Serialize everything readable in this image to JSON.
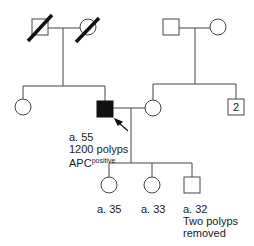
{
  "pedigree": {
    "generation_1": {
      "left_couple": {
        "father": {
          "sex": "male",
          "status": "deceased"
        },
        "mother": {
          "sex": "female",
          "status": "deceased"
        }
      },
      "right_couple": {
        "father": {
          "sex": "male",
          "status": "unaffected"
        },
        "mother": {
          "sex": "female",
          "status": "unaffected"
        }
      }
    },
    "generation_2": {
      "sister": {
        "sex": "female",
        "status": "unaffected"
      },
      "proband": {
        "sex": "male",
        "status": "affected",
        "age_label": "a. 55",
        "finding_label": "1200 polyps",
        "gene_label": "APC",
        "gene_superscript": "positive"
      },
      "spouse": {
        "sex": "female",
        "status": "unaffected"
      },
      "spouse_brothers": {
        "sex": "male",
        "count_label": "2"
      }
    },
    "generation_3": {
      "children": [
        {
          "sex": "female",
          "age_label": "a. 35"
        },
        {
          "sex": "female",
          "age_label": "a. 33"
        },
        {
          "sex": "male",
          "age_label": "a. 32",
          "note_line1": "Two polyps",
          "note_line2": "removed"
        }
      ]
    },
    "colors": {
      "line": "#444444",
      "affected_fill": "#111111",
      "slash": "#111111"
    }
  }
}
